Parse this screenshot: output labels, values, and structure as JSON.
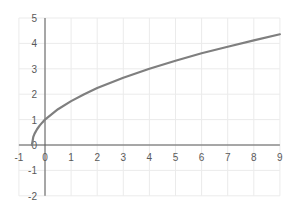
{
  "chart_data": {
    "type": "line",
    "title": "",
    "xlabel": "",
    "ylabel": "",
    "xlim": [
      -1,
      9
    ],
    "ylim": [
      -2,
      5
    ],
    "grid": true,
    "legend": null,
    "x_ticks": [
      "-1",
      "0",
      "1",
      "2",
      "3",
      "4",
      "5",
      "6",
      "7",
      "8",
      "9"
    ],
    "y_ticks": [
      "5",
      "4",
      "3",
      "2",
      "1",
      "0",
      "-1",
      "-2"
    ],
    "series": [
      {
        "name": "y = sqrt(2x+1)",
        "color": "#7f7f7f",
        "x": [
          -0.5,
          -0.45,
          -0.4,
          -0.3,
          -0.2,
          -0.1,
          0,
          0.5,
          1,
          1.5,
          2,
          3,
          4,
          5,
          6,
          7,
          8,
          9
        ],
        "y": [
          0,
          0.32,
          0.45,
          0.63,
          0.77,
          0.89,
          1,
          1.41,
          1.73,
          2,
          2.24,
          2.65,
          3,
          3.32,
          3.61,
          3.87,
          4.12,
          4.36
        ]
      }
    ]
  },
  "colors": {
    "grid": "#ebebeb",
    "axis": "#595959",
    "line": "#7f7f7f"
  }
}
